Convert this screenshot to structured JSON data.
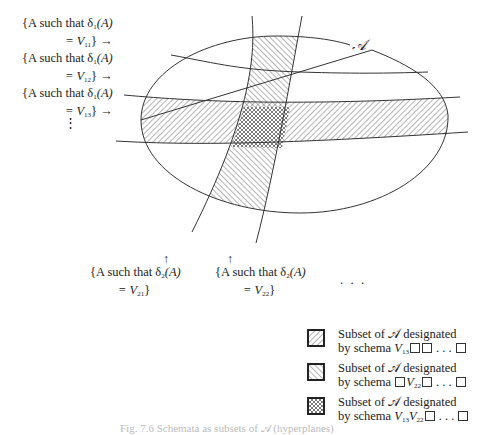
{
  "diagram": {
    "set_label": "𝒜",
    "row_labels": [
      {
        "prefix": "{A such that δ",
        "sub1": "1",
        "mid": "(A)",
        "eq": "= V",
        "sub2": "11",
        "suffix": "} →"
      },
      {
        "prefix": "{A such that δ",
        "sub1": "1",
        "mid": "(A)",
        "eq": "= V",
        "sub2": "12",
        "suffix": "} →"
      },
      {
        "prefix": "{A such that δ",
        "sub1": "1",
        "mid": "(A)",
        "eq": "= V",
        "sub2": "13",
        "suffix": "} →"
      }
    ],
    "row_continuation": "⋮",
    "column_labels": [
      {
        "arrow": "↑",
        "prefix": "{A such that δ",
        "sub1": "2",
        "mid": "(A)",
        "eq": "= V",
        "sub2": "21",
        "suffix": "}"
      },
      {
        "arrow": "↑",
        "prefix": "{A such that δ",
        "sub1": "2",
        "mid": "(A)",
        "eq": "= V",
        "sub2": "22",
        "suffix": "}"
      }
    ],
    "column_continuation": ". . ."
  },
  "legend": [
    {
      "pattern": "hatch-forward",
      "line1": "Subset of 𝒜 designated",
      "line2_prefix": "by schema ",
      "schema": [
        {
          "v": "V",
          "sub": "13"
        },
        {
          "box": true
        },
        {
          "box": true
        },
        {
          "dots": " . . . "
        },
        {
          "box": true
        }
      ]
    },
    {
      "pattern": "hatch-back",
      "line1": "Subset of 𝒜 designated",
      "line2_prefix": "by schema ",
      "schema": [
        {
          "box": true
        },
        {
          "v": "V",
          "sub": "22"
        },
        {
          "box": true
        },
        {
          "dots": " . . . "
        },
        {
          "box": true
        }
      ]
    },
    {
      "pattern": "crosshatch",
      "line1": "Subset of 𝒜 designated",
      "line2_prefix": "by schema ",
      "schema": [
        {
          "v": "V",
          "sub": "13"
        },
        {
          "v": "V",
          "sub": "22"
        },
        {
          "box": true
        },
        {
          "dots": " . . . "
        },
        {
          "box": true
        }
      ]
    }
  ],
  "caption": "Fig. 7.6  Schemata as subsets of 𝒜 (hyperplanes)"
}
